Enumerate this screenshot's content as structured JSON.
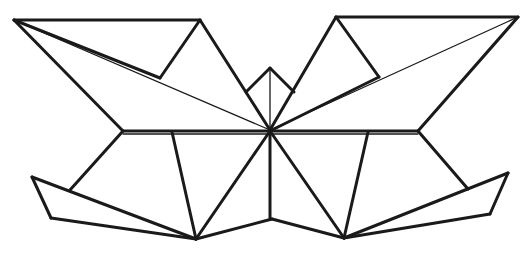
{
  "figure": {
    "stroke_color": "#1a1a1a",
    "background": "#ffffff",
    "thick_lines": [
      [
        [
          14,
          20
        ],
        [
          200,
          20
        ]
      ],
      [
        [
          200,
          20
        ],
        [
          270,
          130
        ]
      ],
      [
        [
          14,
          20
        ],
        [
          160,
          78
        ]
      ],
      [
        [
          160,
          78
        ],
        [
          200,
          20
        ]
      ],
      [
        [
          14,
          20
        ],
        [
          123,
          131
        ]
      ],
      [
        [
          123,
          131
        ],
        [
          418,
          131
        ]
      ],
      [
        [
          336,
          17
        ],
        [
          518,
          17
        ]
      ],
      [
        [
          336,
          17
        ],
        [
          270,
          130
        ]
      ],
      [
        [
          336,
          17
        ],
        [
          379,
          77
        ]
      ],
      [
        [
          379,
          77
        ],
        [
          272,
          130
        ]
      ],
      [
        [
          518,
          17
        ],
        [
          418,
          131
        ]
      ],
      [
        [
          246,
          92
        ],
        [
          270,
          68
        ]
      ],
      [
        [
          270,
          68
        ],
        [
          294,
          92
        ]
      ],
      [
        [
          123,
          131
        ],
        [
          70,
          190
        ]
      ],
      [
        [
          32,
          177
        ],
        [
          51,
          218
        ]
      ],
      [
        [
          51,
          218
        ],
        [
          196,
          239
        ]
      ],
      [
        [
          32,
          177
        ],
        [
          196,
          239
        ]
      ],
      [
        [
          172,
          132
        ],
        [
          196,
          239
        ]
      ],
      [
        [
          270,
          131
        ],
        [
          196,
          239
        ]
      ],
      [
        [
          196,
          239
        ],
        [
          272,
          219
        ]
      ],
      [
        [
          272,
          219
        ],
        [
          344,
          238
        ]
      ],
      [
        [
          270,
          131
        ],
        [
          344,
          238
        ]
      ],
      [
        [
          368,
          132
        ],
        [
          344,
          238
        ]
      ],
      [
        [
          418,
          131
        ],
        [
          468,
          189
        ]
      ],
      [
        [
          508,
          173
        ],
        [
          490,
          214
        ]
      ],
      [
        [
          344,
          238
        ],
        [
          508,
          173
        ]
      ],
      [
        [
          344,
          238
        ],
        [
          490,
          214
        ]
      ],
      [
        [
          270,
          131
        ],
        [
          270,
          219
        ]
      ]
    ],
    "thin_lines": [
      [
        [
          14,
          20
        ],
        [
          270,
          130
        ]
      ],
      [
        [
          518,
          17
        ],
        [
          270,
          130
        ]
      ],
      [
        [
          270,
          68
        ],
        [
          270,
          131
        ]
      ],
      [
        [
          230,
          130
        ],
        [
          200,
          20
        ]
      ]
    ]
  }
}
